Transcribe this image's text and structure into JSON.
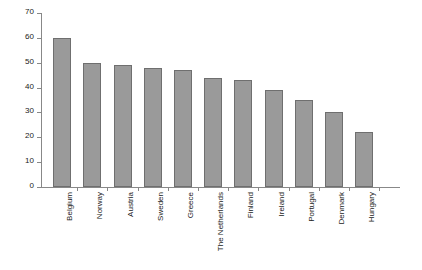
{
  "chart_data": {
    "type": "bar",
    "title": "",
    "subtitle": "",
    "xlabel": "",
    "ylabel": "",
    "ylim": [
      0,
      70
    ],
    "yticks": [
      0,
      10,
      20,
      30,
      40,
      50,
      60,
      70
    ],
    "grid": false,
    "legend": false,
    "orientation": "vertical",
    "bar_color": "#9a9a9a",
    "bar_edge_color": "#6f6f6f",
    "axis_color": "#888888",
    "background_color": "#ffffff",
    "categories": [
      "Belgium",
      "Norway",
      "Austria",
      "Sweden",
      "Greece",
      "The Netherlands",
      "Finland",
      "Ireland",
      "Portugal",
      "Denmark",
      "Hungary"
    ],
    "values": [
      60,
      50,
      49,
      48,
      47,
      44,
      43,
      39,
      35,
      30,
      22
    ]
  }
}
